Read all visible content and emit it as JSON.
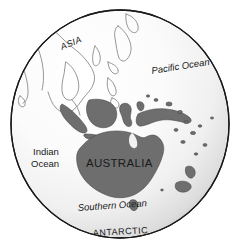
{
  "figure": {
    "background_color": "#ffffff",
    "width": 242,
    "height": 246
  },
  "globe": {
    "name": "globe-sphere",
    "outline_color": "#1a1a1a",
    "highlight_color": "#ffffff",
    "shade_color": "#b9b9b9",
    "center_x": 120,
    "center_y": 124,
    "radius_x": 109,
    "radius_y": 114
  },
  "landmasses": {
    "filled_fill": "#6e6e6e",
    "filled_stroke": "#3d3d3d",
    "outline_stroke": "#7a7a7a",
    "filled": [
      "australia",
      "tasmania",
      "new-guinea",
      "borneo",
      "sulawesi",
      "sumatra",
      "java",
      "new-zealand-north",
      "new-zealand-south",
      "pacific-islands"
    ],
    "outlined": [
      "asia-mainland",
      "japan",
      "korea",
      "philippines",
      "indochina"
    ]
  },
  "labels": {
    "asia": {
      "text": "ASIA",
      "x": 62,
      "y": 50,
      "rotation": -22,
      "style": "region"
    },
    "pacific_ocean": {
      "text": "Pacific Ocean",
      "x": 152,
      "y": 74,
      "rotation": -9,
      "style": "ocean"
    },
    "indian_ocean_line1": {
      "text": "Indian",
      "x": 33,
      "y": 155,
      "rotation": 0,
      "style": "indian"
    },
    "indian_ocean_line2": {
      "text": "Ocean",
      "x": 31,
      "y": 167,
      "rotation": 0,
      "style": "indian"
    },
    "australia": {
      "text": "AUSTRALIA",
      "x": 86,
      "y": 167,
      "rotation": 0,
      "style": "continent"
    },
    "southern_ocean": {
      "text": "Southern Ocean",
      "x": 78,
      "y": 211,
      "rotation": -4,
      "style": "ocean"
    },
    "antarctic": {
      "text": "ANTARCTIC",
      "x": 93,
      "y": 236,
      "rotation": 0,
      "style": "antarctic"
    }
  }
}
